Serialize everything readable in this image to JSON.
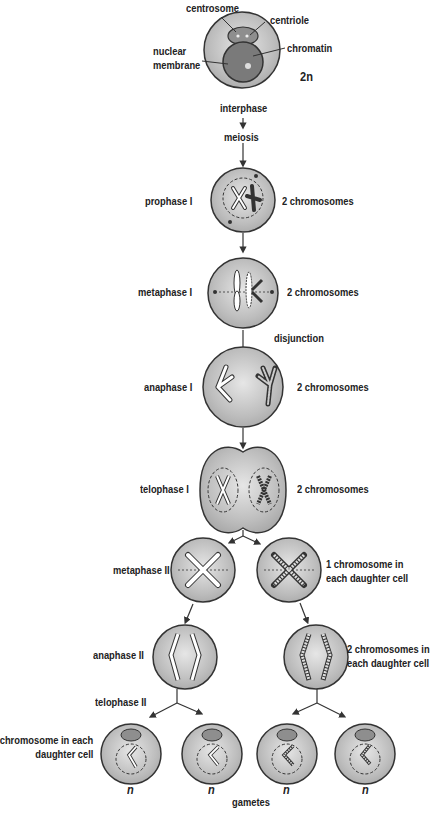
{
  "diagram": {
    "type": "meiosis-flow",
    "colors": {
      "cell_fill": "#b8b8b8",
      "cell_stroke": "#333333",
      "nucleus_fill": "#8a8a8a",
      "chromosome_fill": "#ffffff",
      "text": "#222222"
    },
    "interphase_cell": {
      "labels": {
        "centrosome": "centrosome",
        "centriole": "centriole",
        "nuclear_membrane_line1": "nuclear",
        "nuclear_membrane_line2": "membrane",
        "chromatin": "chromatin",
        "ploidy": "2n"
      }
    },
    "steps": {
      "interphase": "interphase",
      "meiosis": "meiosis",
      "disjunction": "disjunction"
    },
    "stages": [
      {
        "name": "prophase I",
        "note": "2 chromosomes"
      },
      {
        "name": "metaphase I",
        "note": "2 chromosomes"
      },
      {
        "name": "anaphase I",
        "note": "2 chromosomes"
      },
      {
        "name": "telophase I",
        "note": "2 chromosomes"
      },
      {
        "name": "metaphase II",
        "note_line1": "1 chromosome in",
        "note_line2": "each daughter cell"
      },
      {
        "name": "anaphase II",
        "note_line1": "2 chromosomes in",
        "note_line2": "each daughter cell"
      },
      {
        "name": "telophase II",
        "note_line1": "1 chromosome in each",
        "note_line2": "daughter cell"
      }
    ],
    "gametes": {
      "label": "gametes",
      "ploidy": [
        "n",
        "n",
        "n",
        "n"
      ]
    }
  }
}
